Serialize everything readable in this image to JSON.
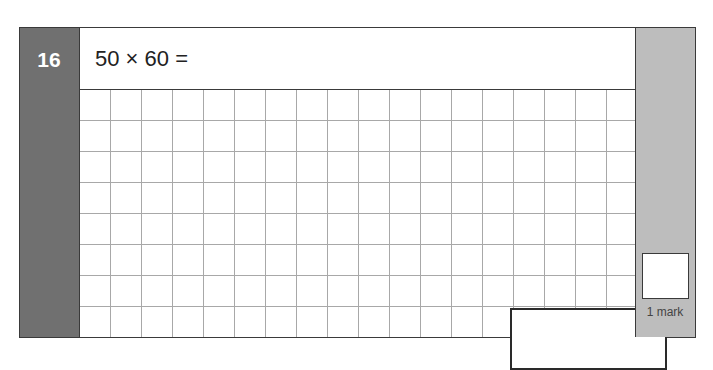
{
  "question": {
    "number": "16",
    "prompt": "50 × 60 =",
    "marks_label": "1 mark"
  },
  "grid": {
    "columns": 18,
    "rows": 8
  },
  "colors": {
    "number_column": "#707070",
    "marks_column": "#bdbdbd",
    "border": "#3a3a3a",
    "grid_line": "#a8a8a8"
  }
}
